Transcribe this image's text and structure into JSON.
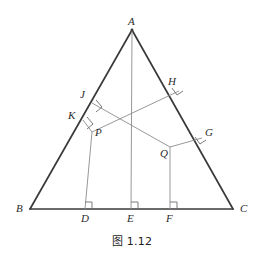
{
  "figure": {
    "caption": "图 1.12",
    "colors": {
      "outline": "#3a3a3a",
      "inner_line": "#8c8c8c",
      "label_text": "#2b2b2b",
      "caption_text": "#1c1c1c",
      "background": "#ffffff"
    },
    "vertices": {
      "A": {
        "label": "A",
        "x": 132,
        "y": 30
      },
      "B": {
        "label": "B",
        "x": 30,
        "y": 209
      },
      "C": {
        "label": "C",
        "x": 233,
        "y": 209
      }
    },
    "base_feet": {
      "D": {
        "label": "D",
        "x": 85,
        "y": 209
      },
      "E": {
        "label": "E",
        "x": 131,
        "y": 209
      },
      "F": {
        "label": "F",
        "x": 170,
        "y": 209
      }
    },
    "interior_points": {
      "P": {
        "label": "P",
        "x": 92,
        "y": 132
      },
      "Q": {
        "label": "Q",
        "x": 170,
        "y": 147
      }
    },
    "feet_on_AB": {
      "J": {
        "label": "J",
        "x": 92,
        "y": 103
      },
      "K": {
        "label": "K",
        "x": 83,
        "y": 120
      }
    },
    "feet_on_AC": {
      "H": {
        "label": "H",
        "x": 179,
        "y": 91
      },
      "G": {
        "label": "G",
        "x": 202,
        "y": 138
      }
    },
    "label_offsets": {
      "A": {
        "x": 128,
        "y": 16
      },
      "B": {
        "x": 16,
        "y": 203
      },
      "C": {
        "x": 240,
        "y": 203
      },
      "D": {
        "x": 81,
        "y": 213
      },
      "E": {
        "x": 127,
        "y": 213
      },
      "F": {
        "x": 166,
        "y": 213
      },
      "P": {
        "x": 95,
        "y": 127
      },
      "Q": {
        "x": 160,
        "y": 148
      },
      "J": {
        "x": 80,
        "y": 89
      },
      "K": {
        "x": 68,
        "y": 110
      },
      "H": {
        "x": 168,
        "y": 76
      },
      "G": {
        "x": 205,
        "y": 127
      }
    },
    "segments": [
      {
        "name": "side-AB",
        "from": "A",
        "to": "B",
        "weight": "thick"
      },
      {
        "name": "side-AC",
        "from": "A",
        "to": "C",
        "weight": "thick"
      },
      {
        "name": "side-BC",
        "from": "B",
        "to": "C",
        "weight": "thick"
      },
      {
        "name": "altitude-AE",
        "from": "A",
        "to": "E",
        "weight": "thin"
      },
      {
        "name": "perpendicular-PD",
        "from": "P",
        "to": "D",
        "weight": "thin"
      },
      {
        "name": "perpendicular-QF",
        "from": "Q",
        "to": "F",
        "weight": "thin"
      },
      {
        "name": "perpendicular-PK",
        "from": "P",
        "to": "K",
        "weight": "thin"
      },
      {
        "name": "perpendicular-PH",
        "from": "P",
        "to": "H",
        "weight": "thin"
      },
      {
        "name": "perpendicular-QJ",
        "from": "Q",
        "to": "J",
        "weight": "thin"
      },
      {
        "name": "perpendicular-QG",
        "from": "Q",
        "to": "G",
        "weight": "thin"
      }
    ],
    "right_angle_marks": [
      {
        "name": "right-angle-at-D",
        "at": "D"
      },
      {
        "name": "right-angle-at-E",
        "at": "E"
      },
      {
        "name": "right-angle-at-F",
        "at": "F"
      },
      {
        "name": "right-angle-at-J",
        "at": "J"
      },
      {
        "name": "right-angle-at-K",
        "at": "K"
      },
      {
        "name": "right-angle-at-H",
        "at": "H"
      },
      {
        "name": "right-angle-at-G",
        "at": "G"
      }
    ]
  }
}
